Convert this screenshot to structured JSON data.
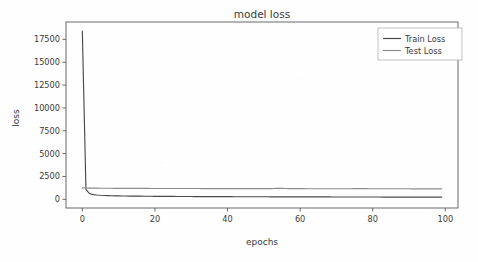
{
  "chart_data": {
    "type": "line",
    "title": "model loss",
    "xlabel": "epochs",
    "ylabel": "loss",
    "xlim": [
      -4.5,
      103.5
    ],
    "ylim": [
      -950,
      19400
    ],
    "grid": false,
    "legend_position": "upper right",
    "xticks": [
      "0",
      "20",
      "40",
      "60",
      "80",
      "100"
    ],
    "xtick_values": [
      0,
      20,
      40,
      60,
      80,
      100
    ],
    "yticks": [
      "0",
      "2500",
      "5000",
      "7500",
      "10000",
      "12500",
      "15000",
      "17500"
    ],
    "ytick_values": [
      0,
      2500,
      5000,
      7500,
      10000,
      12500,
      15000,
      17500
    ],
    "x": [
      0,
      1,
      2,
      3,
      4,
      5,
      6,
      7,
      8,
      9,
      10,
      11,
      12,
      13,
      14,
      15,
      16,
      17,
      18,
      19,
      20,
      21,
      22,
      23,
      24,
      25,
      26,
      27,
      28,
      29,
      30,
      31,
      32,
      33,
      34,
      35,
      36,
      37,
      38,
      39,
      40,
      41,
      42,
      43,
      44,
      45,
      46,
      47,
      48,
      49,
      50,
      51,
      52,
      53,
      54,
      55,
      56,
      57,
      58,
      59,
      60,
      61,
      62,
      63,
      64,
      65,
      66,
      67,
      68,
      69,
      70,
      71,
      72,
      73,
      74,
      75,
      76,
      77,
      78,
      79,
      80,
      81,
      82,
      83,
      84,
      85,
      86,
      87,
      88,
      89,
      90,
      91,
      92,
      93,
      94,
      95,
      96,
      97,
      98,
      99
    ],
    "series": [
      {
        "name": "Train Loss",
        "color": "#4a4a4a",
        "values": [
          18400,
          1050,
          620,
          520,
          470,
          440,
          420,
          405,
          392,
          382,
          374,
          367,
          361,
          355,
          350,
          346,
          342,
          338,
          334,
          331,
          328,
          325,
          322,
          320,
          317,
          315,
          313,
          311,
          309,
          307,
          305,
          303,
          301,
          300,
          298,
          296,
          295,
          293,
          292,
          290,
          289,
          288,
          286,
          285,
          284,
          283,
          281,
          280,
          279,
          278,
          277,
          276,
          275,
          274,
          273,
          272,
          271,
          270,
          269,
          268,
          267,
          266,
          265,
          264,
          263,
          262,
          262,
          261,
          260,
          259,
          258,
          257,
          257,
          256,
          255,
          254,
          253,
          253,
          252,
          251,
          250,
          250,
          249,
          248,
          247,
          247,
          246,
          245,
          245,
          244,
          243,
          243,
          242,
          241,
          241,
          240,
          239,
          239,
          238,
          238
        ]
      },
      {
        "name": "Test Loss",
        "color": "#8c8c8c",
        "values": [
          1250,
          1235,
          1228,
          1222,
          1218,
          1214,
          1211,
          1208,
          1206,
          1204,
          1202,
          1200,
          1198,
          1197,
          1195,
          1194,
          1192,
          1191,
          1190,
          1189,
          1188,
          1187,
          1186,
          1185,
          1184,
          1184,
          1183,
          1182,
          1181,
          1181,
          1180,
          1179,
          1179,
          1178,
          1178,
          1177,
          1177,
          1176,
          1176,
          1175,
          1175,
          1174,
          1174,
          1174,
          1173,
          1173,
          1173,
          1172,
          1172,
          1172,
          1172,
          1171,
          1175,
          1190,
          1215,
          1198,
          1180,
          1172,
          1168,
          1166,
          1164,
          1163,
          1162,
          1161,
          1160,
          1160,
          1159,
          1159,
          1158,
          1158,
          1158,
          1157,
          1157,
          1157,
          1160,
          1168,
          1178,
          1172,
          1164,
          1159,
          1156,
          1155,
          1154,
          1154,
          1153,
          1153,
          1153,
          1152,
          1152,
          1152,
          1152,
          1151,
          1151,
          1151,
          1151,
          1151,
          1150,
          1150,
          1150,
          1150
        ]
      }
    ]
  },
  "legend": {
    "entries": [
      {
        "label": "Train Loss",
        "color": "#4a4a4a"
      },
      {
        "label": "Test Loss",
        "color": "#8c8c8c"
      }
    ]
  },
  "colors": {
    "train": "#4a4a4a",
    "test": "#8c8c8c",
    "axis": "#5a5a5a",
    "text": "#3a3a3a",
    "background": "#fefefe"
  }
}
